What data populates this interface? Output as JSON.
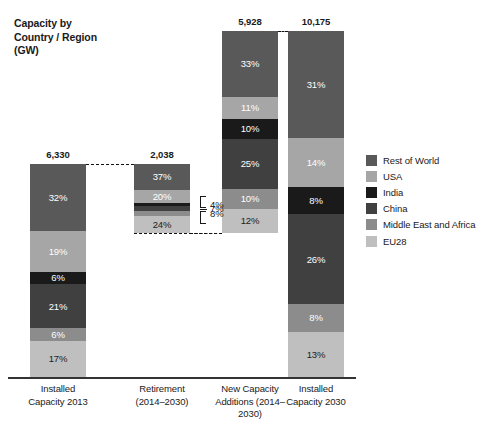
{
  "chart_data": {
    "type": "bar",
    "subtype": "stacked-waterfall",
    "title": "Capacity by\nCountry / Region\n(GW)",
    "xlabel": "",
    "ylabel": "",
    "grid": false,
    "legend_position": "right",
    "stack_mode": "percent",
    "categories": [
      "Installed\nCapacity 2013",
      "Retirement\n(2014–2030)",
      "New Capacity\nAdditions (2014–\n2030)",
      "Installed\nCapacity 2030"
    ],
    "totals": [
      "6,330",
      "2,038",
      "5,928",
      "10,175"
    ],
    "totals_numeric": [
      6330,
      2038,
      5928,
      10175
    ],
    "series": [
      {
        "name": "Rest of World",
        "color": "#595959",
        "values": [
          32,
          37,
          33,
          31
        ]
      },
      {
        "name": "USA",
        "color": "#a6a6a6",
        "values": [
          19,
          20,
          11,
          14
        ]
      },
      {
        "name": "India",
        "color": "#1a1a1a",
        "values": [
          6,
          4,
          10,
          8
        ]
      },
      {
        "name": "China",
        "color": "#404040",
        "values": [
          21,
          7,
          25,
          26
        ]
      },
      {
        "name": "Middle East and Africa",
        "color": "#8c8c8c",
        "values": [
          6,
          8,
          10,
          8
        ]
      },
      {
        "name": "EU28",
        "color": "#bfbfbf",
        "values": [
          17,
          24,
          12,
          13
        ]
      }
    ],
    "bars": [
      {
        "category_key": "installed-capacity-2013",
        "total": "6,330",
        "segments": [
          {
            "series": "Rest of World",
            "label": "32%",
            "value": 32,
            "label_inside": true,
            "label_color": "light"
          },
          {
            "series": "USA",
            "label": "19%",
            "value": 19,
            "label_inside": true,
            "label_color": "light"
          },
          {
            "series": "India",
            "label": "6%",
            "value": 6,
            "label_inside": true,
            "label_color": "light"
          },
          {
            "series": "China",
            "label": "21%",
            "value": 21,
            "label_inside": true,
            "label_color": "light"
          },
          {
            "series": "Middle East and Africa",
            "label": "6%",
            "value": 6,
            "label_inside": true,
            "label_color": "light"
          },
          {
            "series": "EU28",
            "label": "17%",
            "value": 17,
            "label_inside": true,
            "label_color": "dark"
          }
        ]
      },
      {
        "category_key": "retirement-2014-2030",
        "total": "2,038",
        "segments": [
          {
            "series": "Rest of World",
            "label": "37%",
            "value": 37,
            "label_inside": true,
            "label_color": "light"
          },
          {
            "series": "USA",
            "label": "20%",
            "value": 20,
            "label_inside": true,
            "label_color": "light"
          },
          {
            "series": "India",
            "label": "4%",
            "value": 4,
            "label_inside": false,
            "label_color": "dark"
          },
          {
            "series": "China",
            "label": "7%",
            "value": 7,
            "label_inside": false,
            "label_color": "dark"
          },
          {
            "series": "Middle East and Africa",
            "label": "8%",
            "value": 8,
            "label_inside": false,
            "label_color": "dark"
          },
          {
            "series": "EU28",
            "label": "24%",
            "value": 24,
            "label_inside": true,
            "label_color": "dark"
          }
        ]
      },
      {
        "category_key": "new-capacity-additions-2014-2030",
        "total": "5,928",
        "segments": [
          {
            "series": "Rest of World",
            "label": "33%",
            "value": 33,
            "label_inside": true,
            "label_color": "light"
          },
          {
            "series": "USA",
            "label": "11%",
            "value": 11,
            "label_inside": true,
            "label_color": "light"
          },
          {
            "series": "India",
            "label": "10%",
            "value": 10,
            "label_inside": true,
            "label_color": "light"
          },
          {
            "series": "China",
            "label": "25%",
            "value": 25,
            "label_inside": true,
            "label_color": "light"
          },
          {
            "series": "Middle East and Africa",
            "label": "10%",
            "value": 10,
            "label_inside": true,
            "label_color": "light"
          },
          {
            "series": "EU28",
            "label": "12%",
            "value": 12,
            "label_inside": true,
            "label_color": "dark"
          }
        ]
      },
      {
        "category_key": "installed-capacity-2030",
        "total": "10,175",
        "segments": [
          {
            "series": "Rest of World",
            "label": "31%",
            "value": 31,
            "label_inside": true,
            "label_color": "light"
          },
          {
            "series": "USA",
            "label": "14%",
            "value": 14,
            "label_inside": true,
            "label_color": "light"
          },
          {
            "series": "India",
            "label": "8%",
            "value": 8,
            "label_inside": true,
            "label_color": "light"
          },
          {
            "series": "China",
            "label": "26%",
            "value": 26,
            "label_inside": true,
            "label_color": "light"
          },
          {
            "series": "Middle East and Africa",
            "label": "8%",
            "value": 8,
            "label_inside": true,
            "label_color": "light"
          },
          {
            "series": "EU28",
            "label": "13%",
            "value": 13,
            "label_inside": true,
            "label_color": "dark"
          }
        ]
      }
    ],
    "callouts": [
      {
        "label": "4%",
        "series": "India"
      },
      {
        "label": "7%",
        "series": "China"
      },
      {
        "label": "8%",
        "series": "Middle East and Africa"
      }
    ],
    "connectors": [
      {
        "from_bar": 0,
        "to_bar": 1,
        "edge": "top"
      },
      {
        "from_bar": 1,
        "to_bar": 2,
        "edge": "bottom"
      },
      {
        "from_bar": 2,
        "to_bar": 3,
        "edge": "top"
      }
    ]
  },
  "legend": {
    "items": [
      {
        "label": "Rest of World",
        "color": "#595959"
      },
      {
        "label": "USA",
        "color": "#a6a6a6"
      },
      {
        "label": "India",
        "color": "#1a1a1a"
      },
      {
        "label": "China",
        "color": "#404040"
      },
      {
        "label": "Middle East and Africa",
        "color": "#8c8c8c"
      },
      {
        "label": "EU28",
        "color": "#bfbfbf"
      }
    ]
  }
}
